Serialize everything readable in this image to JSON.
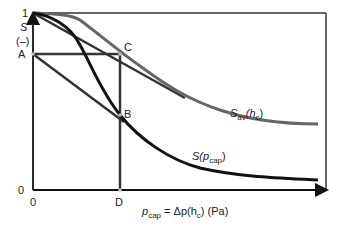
{
  "diagram": {
    "type": "capillary saturation curve schematic",
    "y_axis": {
      "symbol": "S",
      "unit": "(–)",
      "tick_top": "1",
      "tick_bottom": "0"
    },
    "x_axis": {
      "tick_origin": "0",
      "label_prefix": "p",
      "label_sub": "cap",
      "label_eq": " = Δp(h",
      "label_sub2": "c",
      "label_tail": ") (Pa)"
    },
    "points": {
      "A": "A",
      "B": "B",
      "C": "C",
      "D": "D"
    },
    "curves": {
      "sav": {
        "name": "S",
        "sub": "av",
        "arg_open": "(h",
        "arg_sub": "c",
        "arg_close": ")",
        "color": "#555555"
      },
      "scap": {
        "name": "S(p",
        "sub": "cap",
        "close": ")",
        "color": "#111111"
      }
    }
  }
}
